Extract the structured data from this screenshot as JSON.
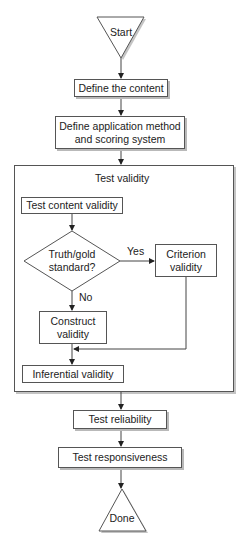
{
  "diagram": {
    "type": "flowchart",
    "start": {
      "label": "Start",
      "shape": "inverted-triangle"
    },
    "steps": [
      {
        "id": "define-content",
        "label": "Define the content"
      },
      {
        "id": "define-method",
        "label": "Define application method and scoring system",
        "lines": [
          "Define application method",
          "and scoring system"
        ]
      }
    ],
    "validity_group": {
      "title": "Test validity",
      "content_validity": "Test content validity",
      "decision": {
        "lines": [
          "Truth/gold",
          "standard?"
        ],
        "yes_label": "Yes",
        "no_label": "No"
      },
      "criterion": {
        "lines": [
          "Criterion",
          "validity"
        ]
      },
      "construct": {
        "lines": [
          "Construct",
          "validity"
        ]
      },
      "inferential": "Inferential validity"
    },
    "after_steps": [
      {
        "id": "reliability",
        "label": "Test reliability"
      },
      {
        "id": "responsiveness",
        "label": "Test responsiveness"
      }
    ],
    "end": {
      "label": "Done",
      "shape": "triangle"
    },
    "colors": {
      "stroke": "#555555",
      "shadow": "#b9b9b9",
      "fill": "#ffffff",
      "text": "#222222"
    }
  }
}
